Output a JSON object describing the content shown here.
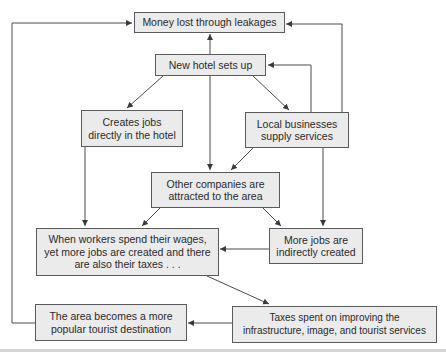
{
  "diagram": {
    "colors": {
      "box_fill": "#ebebeb",
      "box_border": "#5a5a5a",
      "line": "#4a4a4a",
      "text": "#2a2a2a"
    },
    "nodes": {
      "leakages": {
        "label": "Money lost through leakages"
      },
      "new_hotel": {
        "label": "New hotel sets up"
      },
      "direct_jobs": {
        "line1": "Creates jobs",
        "line2": "directly in the hotel"
      },
      "local_businesses": {
        "line1": "Local businesses",
        "line2": "supply services"
      },
      "other_companies": {
        "line1": "Other companies are",
        "line2": "attracted to the area"
      },
      "workers_spend": {
        "line1": "When workers spend their wages,",
        "line2": "yet more jobs are created and there",
        "line3": "are also their taxes . . ."
      },
      "indirect_jobs": {
        "line1": "More jobs are",
        "line2": "indirectly created"
      },
      "tourist_destination": {
        "line1": "The area becomes a more",
        "line2": "popular tourist destination"
      },
      "taxes_spent": {
        "line1": "Taxes spent on improving the",
        "line2": "infrastructure, image, and tourist services"
      }
    },
    "edges": [
      {
        "from": "new_hotel",
        "to": "leakages"
      },
      {
        "from": "new_hotel",
        "to": "direct_jobs"
      },
      {
        "from": "new_hotel",
        "to": "local_businesses"
      },
      {
        "from": "new_hotel",
        "to": "other_companies"
      },
      {
        "from": "local_businesses",
        "to": "new_hotel"
      },
      {
        "from": "local_businesses",
        "to": "leakages"
      },
      {
        "from": "local_businesses",
        "to": "other_companies"
      },
      {
        "from": "local_businesses",
        "to": "indirect_jobs"
      },
      {
        "from": "direct_jobs",
        "to": "workers_spend"
      },
      {
        "from": "other_companies",
        "to": "workers_spend"
      },
      {
        "from": "other_companies",
        "to": "indirect_jobs"
      },
      {
        "from": "indirect_jobs",
        "to": "workers_spend"
      },
      {
        "from": "workers_spend",
        "to": "taxes_spent"
      },
      {
        "from": "taxes_spent",
        "to": "tourist_destination"
      },
      {
        "from": "tourist_destination",
        "to": "leakages"
      }
    ]
  }
}
